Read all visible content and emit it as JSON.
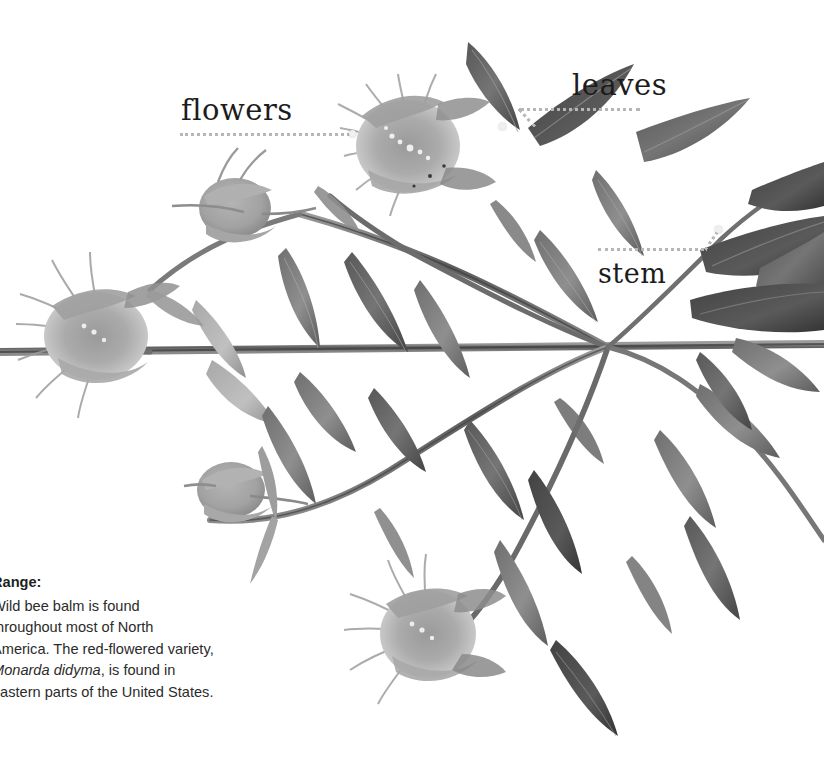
{
  "page": {
    "background_color": "#ffffff",
    "width": 824,
    "height": 771
  },
  "callouts": [
    {
      "id": "flowers",
      "label": "flowers",
      "icon": "dotted-leader-line",
      "marker": "callout-dot"
    },
    {
      "id": "leaves",
      "label": "leaves",
      "icon": "dotted-leader-line",
      "marker": "callout-dot"
    },
    {
      "id": "stem",
      "label": "stem",
      "icon": "dotted-leader-line",
      "marker": "callout-dot"
    }
  ],
  "range": {
    "heading": "Range:",
    "line1": "Wild bee balm is found",
    "line2": "throughout most of North",
    "line3": "America. The red-flowered variety,",
    "species": "Monarda didyma",
    "line4_tail": ", is found in",
    "line5": "eastern parts of the United States."
  },
  "colors": {
    "leader": "#b9b5b2",
    "label_text": "#1d1c1c",
    "body_text": "#2b2b2b",
    "specimen_dark": "#4a4a4a",
    "specimen_mid": "#8d8d8d",
    "specimen_light": "#bdbdbd"
  }
}
